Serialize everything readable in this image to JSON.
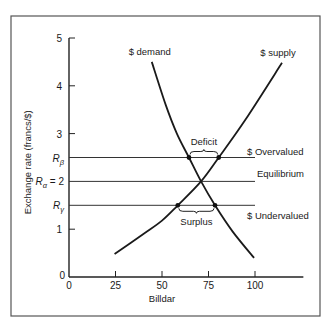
{
  "chart_data": {
    "type": "line",
    "title": "",
    "xlabel": "Billdar",
    "ylabel": "Exchange rate (francs/$)",
    "xlim": [
      0,
      125
    ],
    "ylim": [
      0,
      5
    ],
    "grid": false,
    "x_ticks": [
      {
        "value": 0,
        "label": "0"
      },
      {
        "value": 25,
        "label": "25"
      },
      {
        "value": 50,
        "label": "50"
      },
      {
        "value": 75,
        "label": "75"
      },
      {
        "value": 100,
        "label": "100"
      }
    ],
    "y_ticks": [
      {
        "value": 0,
        "label": "0"
      },
      {
        "value": 1,
        "label": "1"
      },
      {
        "value": 3,
        "label": "3"
      },
      {
        "value": 4,
        "label": "4"
      },
      {
        "value": 5,
        "label": "5"
      }
    ],
    "series": [
      {
        "name": "$ demand",
        "points": [
          [
            44.5,
            4.5
          ],
          [
            52,
            3.6
          ],
          [
            58,
            3.0
          ],
          [
            64.5,
            2.5
          ],
          [
            71,
            2.0
          ],
          [
            78.5,
            1.5
          ],
          [
            88,
            0.95
          ],
          [
            99.5,
            0.4
          ]
        ]
      },
      {
        "name": "$ supply",
        "points": [
          [
            24.5,
            0.48
          ],
          [
            40,
            0.9
          ],
          [
            50,
            1.18
          ],
          [
            58.5,
            1.5
          ],
          [
            71,
            2.0
          ],
          [
            80.5,
            2.5
          ],
          [
            95,
            3.3
          ],
          [
            114.5,
            4.48
          ]
        ]
      }
    ],
    "reference_lines": [
      {
        "name": "rate-beta",
        "y": 2.5,
        "axis_label_main": "R",
        "axis_label_sub": "β",
        "axis_label_suffix": "",
        "x_end": 100,
        "annotation": "$ Overvalued"
      },
      {
        "name": "rate-alpha",
        "y": 2.0,
        "axis_label_main": "R",
        "axis_label_sub": "α",
        "axis_label_suffix": " = 2",
        "x_end": 100,
        "annotation": "Equilibrium"
      },
      {
        "name": "rate-gamma",
        "y": 1.5,
        "axis_label_main": "R",
        "axis_label_sub": "γ",
        "axis_label_suffix": "",
        "x_end": 100,
        "annotation": "$ Undervalued"
      }
    ],
    "marked_points": [
      {
        "x": 64.5,
        "y": 2.5
      },
      {
        "x": 80.5,
        "y": 2.5
      },
      {
        "x": 58.5,
        "y": 1.5
      },
      {
        "x": 78.5,
        "y": 1.5
      }
    ],
    "braces": [
      {
        "label": "Deficit",
        "x_from": 64.5,
        "x_to": 80.5,
        "y": 2.5,
        "direction": "above"
      },
      {
        "label": "Surplus",
        "x_from": 58.5,
        "x_to": 78.5,
        "y": 1.5,
        "direction": "below"
      }
    ],
    "curve_labels": [
      {
        "text": "$ demand",
        "series": "$ demand"
      },
      {
        "text": "$ supply",
        "series": "$ supply"
      }
    ]
  }
}
